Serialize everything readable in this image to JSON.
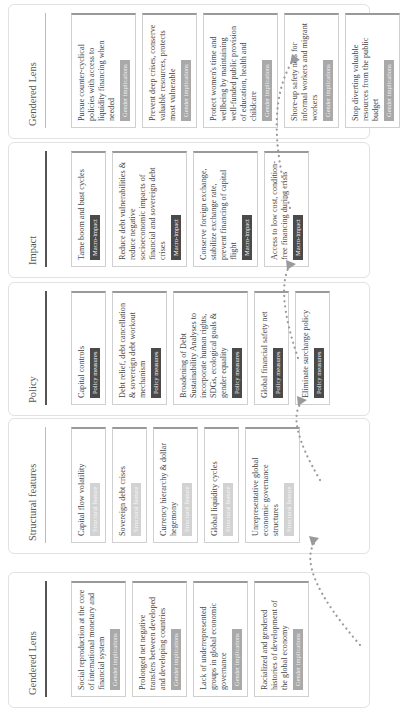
{
  "diagram": {
    "flow_direction": "Gendered Lens -> Structural features -> Policy -> Impact -> Gendered Lens",
    "panels": [
      {
        "title": "Gendered Lens",
        "tag_style": "gender",
        "cards": [
          {
            "text": "Social reproduction at the core of international monetary and financial system",
            "tag": "Gender implications"
          },
          {
            "text": "Prolonged net negative transfers between developed and developing countries",
            "tag": "Gender implications"
          },
          {
            "text": "Lack of underrepresented groups in global economic governance",
            "tag": "Gender implications"
          },
          {
            "text": "Racialized and gendered histories of development of the global economy",
            "tag": "Gender implications"
          }
        ]
      },
      {
        "title": "Structural features",
        "tag_style": "struct",
        "cards": [
          {
            "text": "Capital flow volatility",
            "tag": "Structural feature"
          },
          {
            "text": "Sovereign debt crises",
            "tag": "Structural feature"
          },
          {
            "text": "Currency hierarchy & dollar hegemony",
            "tag": "Structural feature"
          },
          {
            "text": "Global liquidity cycles",
            "tag": "Structural feature"
          },
          {
            "text": "Unrepresentative global economic governance structures",
            "tag": "Structural feature"
          }
        ]
      },
      {
        "title": "Policy",
        "tag_style": "policy",
        "cards": [
          {
            "text": "Capital controls",
            "tag": "Policy measures"
          },
          {
            "text": "Debt relief, debt cancellation & sovereign debt workout mechanism",
            "tag": "Policy measures"
          },
          {
            "text": "Broadening of Debt Sustainability Analyses to incorporate human rights, SDGs, ecological goals & gender equality",
            "tag": "Policy measures"
          },
          {
            "text": "Global financial safety net",
            "tag": "Policy measures"
          },
          {
            "text": "Eliminate surcharge policy",
            "tag": "Policy measures"
          }
        ]
      },
      {
        "title": "Impact",
        "tag_style": "macro",
        "cards": [
          {
            "text": "Tame boom and bust cycles",
            "tag": "Macro-impact"
          },
          {
            "text": "Reduce debt vulnerabilities & reduce negative socioeconomic impacts of financial and sovereign debt crises",
            "tag": "Macro-impact"
          },
          {
            "text": "Conserve foreign exchange, stabilize exchange rate, prevent financing of capital flight",
            "tag": "Macro-impact"
          },
          {
            "text": "Access to low cost, condition-free financing during crisis",
            "tag": "Macro-impact"
          }
        ]
      },
      {
        "title": "Gendered Lens",
        "tag_style": "gender",
        "cards": [
          {
            "text": "Pursue counter-cyclical policies with access to liquidity financing when needed",
            "tag": "Gender implications"
          },
          {
            "text": "Prevent deep crises, conserve valuable resources, protects most vulnerable",
            "tag": "Gender implications"
          },
          {
            "text": "Protect women's time and wellbeing by maintaining well-funded public provision of education, health and childcare",
            "tag": "Gender implications"
          },
          {
            "text": "Shore-up safety nets for informal workers and migrant workers",
            "tag": "Gender implications"
          },
          {
            "text": "Stop diverting valuable resources from the public budget",
            "tag": "Gender implications"
          }
        ]
      }
    ],
    "connectors": [
      {
        "from": "Gendered Lens",
        "to": "Structural features",
        "style": "dotted-curved-arrow"
      },
      {
        "from": "Structural features",
        "to": "Policy",
        "style": "dotted-curved-arrow"
      },
      {
        "from": "Policy",
        "to": "Impact",
        "style": "dotted-curved-arrow"
      },
      {
        "from": "Impact",
        "to": "Gendered Lens",
        "style": "dotted-curved-arrow"
      }
    ],
    "colors": {
      "dark_tag": "#4a4a4a",
      "mid_tag": "#a9a9a9",
      "light_tag": "#d2d2d2",
      "arrow": "#9a9a9a",
      "border": "#d0d0d0"
    }
  }
}
